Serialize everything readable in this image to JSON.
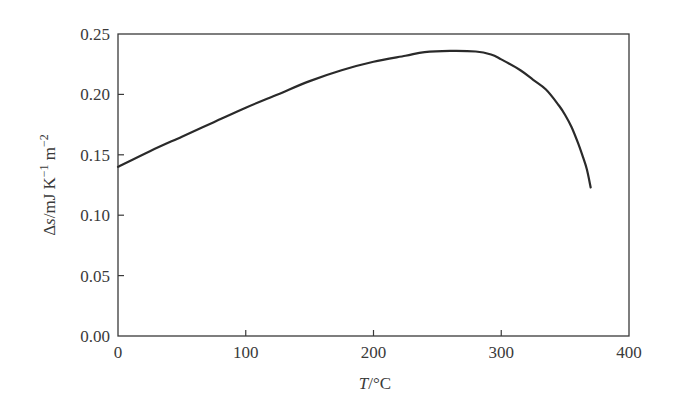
{
  "chart_data": {
    "type": "line",
    "title": "",
    "xlabel": "T/°C",
    "xlabel_parts": {
      "italic": "T",
      "rest": "/°C"
    },
    "ylabel": "Δs/mJ K⁻¹ m⁻²",
    "ylabel_parts": {
      "delta": "Δ",
      "italic": "s",
      "unit_a": "/mJ K",
      "sup_a": "−1",
      "unit_b": " m",
      "sup_b": "−2"
    },
    "xlim": [
      0,
      400
    ],
    "ylim": [
      0.0,
      0.25
    ],
    "xticks": [
      0,
      100,
      200,
      300,
      400
    ],
    "xtick_labels": [
      "0",
      "100",
      "200",
      "300",
      "400"
    ],
    "yticks": [
      0.0,
      0.05,
      0.1,
      0.15,
      0.2,
      0.25
    ],
    "ytick_labels": [
      "0.00",
      "0.05",
      "0.10",
      "0.15",
      "0.20",
      "0.25"
    ],
    "grid": false,
    "legend": null,
    "line_color": "#2a2a2a",
    "series": [
      {
        "name": "Δs vs T",
        "x": [
          0,
          25,
          50,
          75,
          100,
          125,
          150,
          175,
          200,
          225,
          240,
          260,
          280,
          292,
          300,
          315,
          325,
          335,
          345,
          350,
          355,
          360,
          364,
          367,
          370
        ],
        "y": [
          0.14,
          0.153,
          0.165,
          0.177,
          0.189,
          0.2,
          0.211,
          0.22,
          0.227,
          0.232,
          0.235,
          0.236,
          0.2355,
          0.233,
          0.229,
          0.22,
          0.212,
          0.204,
          0.191,
          0.183,
          0.173,
          0.16,
          0.148,
          0.138,
          0.123
        ]
      }
    ]
  }
}
